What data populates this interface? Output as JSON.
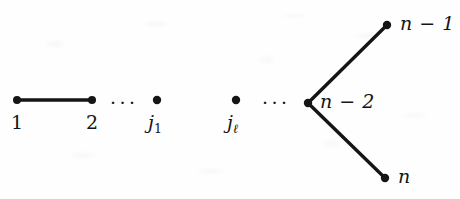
{
  "figure": {
    "kind": "graph-diagram",
    "background_color": "#fefefe",
    "ink_color": "#151515",
    "width": 460,
    "height": 199
  },
  "nodes": [
    {
      "id": "v1",
      "label": "1",
      "label_html": "1",
      "x": 17,
      "y": 100,
      "label_x": 11,
      "label_y": 113,
      "radius": 4.0
    },
    {
      "id": "v2",
      "label": "2",
      "label_html": "2",
      "x": 92,
      "y": 100,
      "label_x": 86,
      "label_y": 113,
      "radius": 4.0
    },
    {
      "id": "vj1",
      "label": "j_1",
      "label_html": "j<span class=\"sub\">1</span>",
      "x": 157,
      "y": 100,
      "label_x": 148,
      "label_y": 113,
      "radius": 4.2
    },
    {
      "id": "vjl",
      "label": "j_l",
      "label_html": "j<span class=\"sub-ell\">&#8467;</span>",
      "x": 236,
      "y": 100,
      "label_x": 227,
      "label_y": 113,
      "radius": 4.2
    },
    {
      "id": "vn2",
      "label": "n - 2",
      "label_html": "n<span class=\"minus-sp\"> &#8722; </span>2",
      "x": 308,
      "y": 103,
      "label_x": 320,
      "label_y": 92,
      "radius": 4.2
    },
    {
      "id": "vn1",
      "label": "n - 1",
      "label_html": "n<span class=\"minus-sp\"> &#8722; </span>1",
      "x": 387,
      "y": 25,
      "label_x": 400,
      "label_y": 14,
      "radius": 4.2
    },
    {
      "id": "vn",
      "label": "n",
      "label_html": "n",
      "x": 385,
      "y": 178,
      "label_x": 398,
      "label_y": 167,
      "radius": 4.2
    }
  ],
  "edges": [
    {
      "id": "e-1-2",
      "from": "v1",
      "to": "v2",
      "x1": 17,
      "y1": 100,
      "x2": 92,
      "y2": 100,
      "width": 3.4
    },
    {
      "id": "e-n2-n1",
      "from": "vn2",
      "to": "vn1",
      "x1": 308,
      "y1": 103,
      "x2": 387,
      "y2": 25,
      "width": 3.4
    },
    {
      "id": "e-n2-n",
      "from": "vn2",
      "to": "vn",
      "x1": 308,
      "y1": 103,
      "x2": 385,
      "y2": 178,
      "width": 3.4
    }
  ],
  "ellipses": [
    {
      "id": "dots-left",
      "text": "···",
      "x": 110,
      "y": 93
    },
    {
      "id": "dots-right",
      "text": "···",
      "x": 262,
      "y": 93
    }
  ]
}
